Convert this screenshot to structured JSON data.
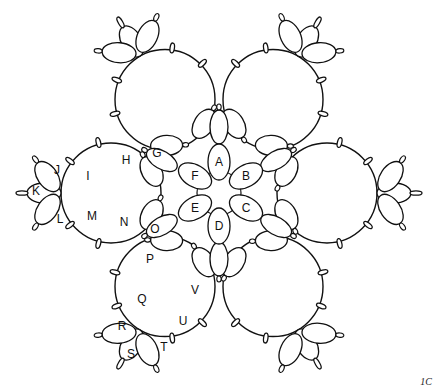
{
  "diagram": {
    "type": "tatting-pattern",
    "stroke_color": "#111111",
    "background": "#ffffff",
    "center": [
      219,
      193
    ],
    "center_rings": [
      {
        "label": "A",
        "x": 219,
        "y": 162,
        "angle": 0
      },
      {
        "label": "B",
        "x": 246,
        "y": 176,
        "angle": 60
      },
      {
        "label": "C",
        "x": 246,
        "y": 208,
        "angle": 120
      },
      {
        "label": "D",
        "x": 219,
        "y": 226,
        "angle": 180
      },
      {
        "label": "E",
        "x": 195,
        "y": 208,
        "angle": 240
      },
      {
        "label": "F",
        "x": 195,
        "y": 176,
        "angle": 300
      }
    ],
    "arc_ring_labels": [
      {
        "label": "G",
        "x": 157,
        "y": 153
      },
      {
        "label": "H",
        "x": 126,
        "y": 160
      },
      {
        "label": "I",
        "x": 88,
        "y": 176
      },
      {
        "label": "J",
        "x": 57,
        "y": 170
      },
      {
        "label": "K",
        "x": 36,
        "y": 191
      },
      {
        "label": "L",
        "x": 60,
        "y": 219
      },
      {
        "label": "M",
        "x": 92,
        "y": 216
      },
      {
        "label": "N",
        "x": 124,
        "y": 222
      },
      {
        "label": "O",
        "x": 155,
        "y": 229
      },
      {
        "label": "P",
        "x": 150,
        "y": 259
      },
      {
        "label": "Q",
        "x": 142,
        "y": 299
      },
      {
        "label": "R",
        "x": 122,
        "y": 326
      },
      {
        "label": "S",
        "x": 131,
        "y": 354
      },
      {
        "label": "T",
        "x": 164,
        "y": 347
      },
      {
        "label": "U",
        "x": 183,
        "y": 321
      },
      {
        "label": "V",
        "x": 195,
        "y": 290
      }
    ],
    "corner_label": "1C"
  }
}
